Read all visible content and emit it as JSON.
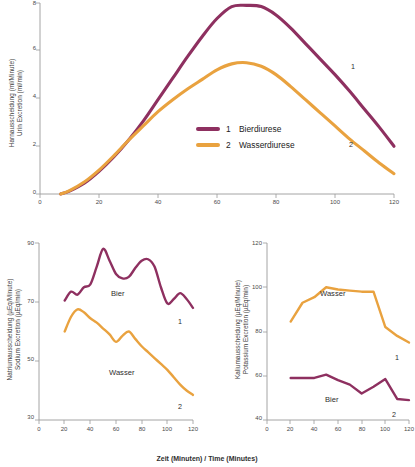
{
  "figure": {
    "xaxis_title": "Zeit (Minuten) / Time (Minutes)"
  },
  "chart_data": [
    {
      "id": "urine_excretion",
      "type": "line",
      "title": "",
      "xlabel": "Zeit (Minuten) / Time (Minutes)",
      "ylabel": "Harnausscheidung (ml/Minute)\nUrin Excretion (ml/min)",
      "ylabel_line1": "Harnausscheidung (ml/Minute)",
      "ylabel_line2": "Urin Excretion (ml/min)",
      "xlim": [
        0,
        120
      ],
      "ylim": [
        0,
        8
      ],
      "xticks": [
        0,
        20,
        40,
        60,
        80,
        100,
        120
      ],
      "yticks": [
        0,
        2,
        4,
        6,
        8
      ],
      "grid": false,
      "legend_position": "center",
      "legend": [
        {
          "number": "1",
          "label": "Bierdiurese",
          "color": "#8e3060"
        },
        {
          "number": "2",
          "label": "Wasserdiurese",
          "color": "#e9a23f"
        }
      ],
      "series": [
        {
          "name": "Bierdiurese",
          "number": "1",
          "color": "#8e3060",
          "x": [
            7,
            10,
            15,
            20,
            25,
            30,
            35,
            40,
            45,
            50,
            55,
            60,
            65,
            70,
            75,
            80,
            85,
            90,
            95,
            100,
            105,
            110,
            115,
            120
          ],
          "values": [
            0.0,
            0.12,
            0.45,
            0.95,
            1.55,
            2.25,
            3.05,
            3.95,
            4.85,
            5.75,
            6.6,
            7.35,
            7.85,
            7.9,
            7.85,
            7.5,
            6.95,
            6.3,
            5.65,
            5.0,
            4.3,
            3.55,
            2.8,
            2.0
          ]
        },
        {
          "name": "Wasserdiurese",
          "number": "2",
          "color": "#e9a23f",
          "x": [
            7,
            10,
            15,
            20,
            25,
            30,
            35,
            40,
            45,
            50,
            55,
            60,
            65,
            70,
            75,
            80,
            85,
            90,
            95,
            100,
            105,
            110,
            115,
            120
          ],
          "values": [
            0.0,
            0.14,
            0.5,
            1.0,
            1.6,
            2.25,
            2.85,
            3.45,
            3.95,
            4.4,
            4.8,
            5.2,
            5.45,
            5.5,
            5.35,
            5.0,
            4.5,
            3.95,
            3.4,
            2.85,
            2.3,
            1.8,
            1.3,
            0.85
          ]
        }
      ]
    },
    {
      "id": "sodium_excretion",
      "type": "line",
      "title": "",
      "xlabel": "Zeit (Minuten) / Time (Minutes)",
      "ylabel_line1": "Natriumausscheidung (µEq/Minute)",
      "ylabel_line2": "Sodium Excretion (µEq/min)",
      "xlim": [
        0,
        120
      ],
      "ylim": [
        30,
        90
      ],
      "xticks": [
        0,
        20,
        40,
        60,
        80,
        100,
        120
      ],
      "yticks": [
        30,
        50,
        70,
        90
      ],
      "grid": false,
      "series": [
        {
          "name": "Bier",
          "number": "1",
          "color": "#8e3060",
          "inline_label": "Bier",
          "x": [
            20,
            25,
            30,
            35,
            40,
            45,
            50,
            55,
            60,
            65,
            70,
            75,
            80,
            85,
            90,
            95,
            100,
            105,
            110,
            115,
            120
          ],
          "values": [
            70.5,
            73.5,
            72.5,
            75.0,
            76.0,
            82.0,
            88.0,
            84.0,
            79.5,
            78.0,
            78.5,
            81.5,
            84.0,
            84.5,
            82.0,
            75.0,
            69.5,
            71.0,
            73.0,
            71.0,
            68.0
          ]
        },
        {
          "name": "Wasser",
          "number": "2",
          "color": "#e9a23f",
          "inline_label": "Wasser",
          "x": [
            20,
            25,
            30,
            35,
            40,
            45,
            50,
            55,
            60,
            65,
            70,
            75,
            80,
            85,
            90,
            95,
            100,
            105,
            110,
            115,
            120
          ],
          "values": [
            60.0,
            65.0,
            67.5,
            66.5,
            64.5,
            63.0,
            61.0,
            59.0,
            56.5,
            58.5,
            60.0,
            57.5,
            55.0,
            53.0,
            51.0,
            49.0,
            47.0,
            44.5,
            42.0,
            40.0,
            38.5
          ]
        }
      ]
    },
    {
      "id": "potassium_excretion",
      "type": "line",
      "title": "",
      "xlabel": "Zeit (Minuten) / Time (Minutes)",
      "ylabel_line1": "Kaliumausscheidung (µEq/Minute)",
      "ylabel_line2": "Potassium Excretion (µEq/min)",
      "xlim": [
        0,
        120
      ],
      "ylim": [
        40,
        120
      ],
      "xticks": [
        0,
        20,
        40,
        60,
        80,
        100,
        120
      ],
      "yticks": [
        40,
        60,
        80,
        100,
        120
      ],
      "grid": false,
      "series": [
        {
          "name": "Wasser",
          "number": "1",
          "color": "#e9a23f",
          "inline_label": "Wasser",
          "x": [
            20,
            30,
            40,
            50,
            60,
            70,
            80,
            90,
            100,
            110,
            120
          ],
          "values": [
            84.5,
            93.0,
            95.5,
            100.0,
            99.0,
            98.5,
            98.0,
            98.0,
            82.0,
            78.0,
            75.0
          ]
        },
        {
          "name": "Bier",
          "number": "2",
          "color": "#8e3060",
          "inline_label": "Bier",
          "x": [
            20,
            30,
            40,
            50,
            60,
            70,
            80,
            90,
            100,
            110,
            120
          ],
          "values": [
            59.0,
            59.0,
            59.0,
            60.5,
            58.0,
            56.0,
            52.0,
            55.0,
            58.5,
            49.5,
            49.0
          ]
        }
      ]
    }
  ]
}
